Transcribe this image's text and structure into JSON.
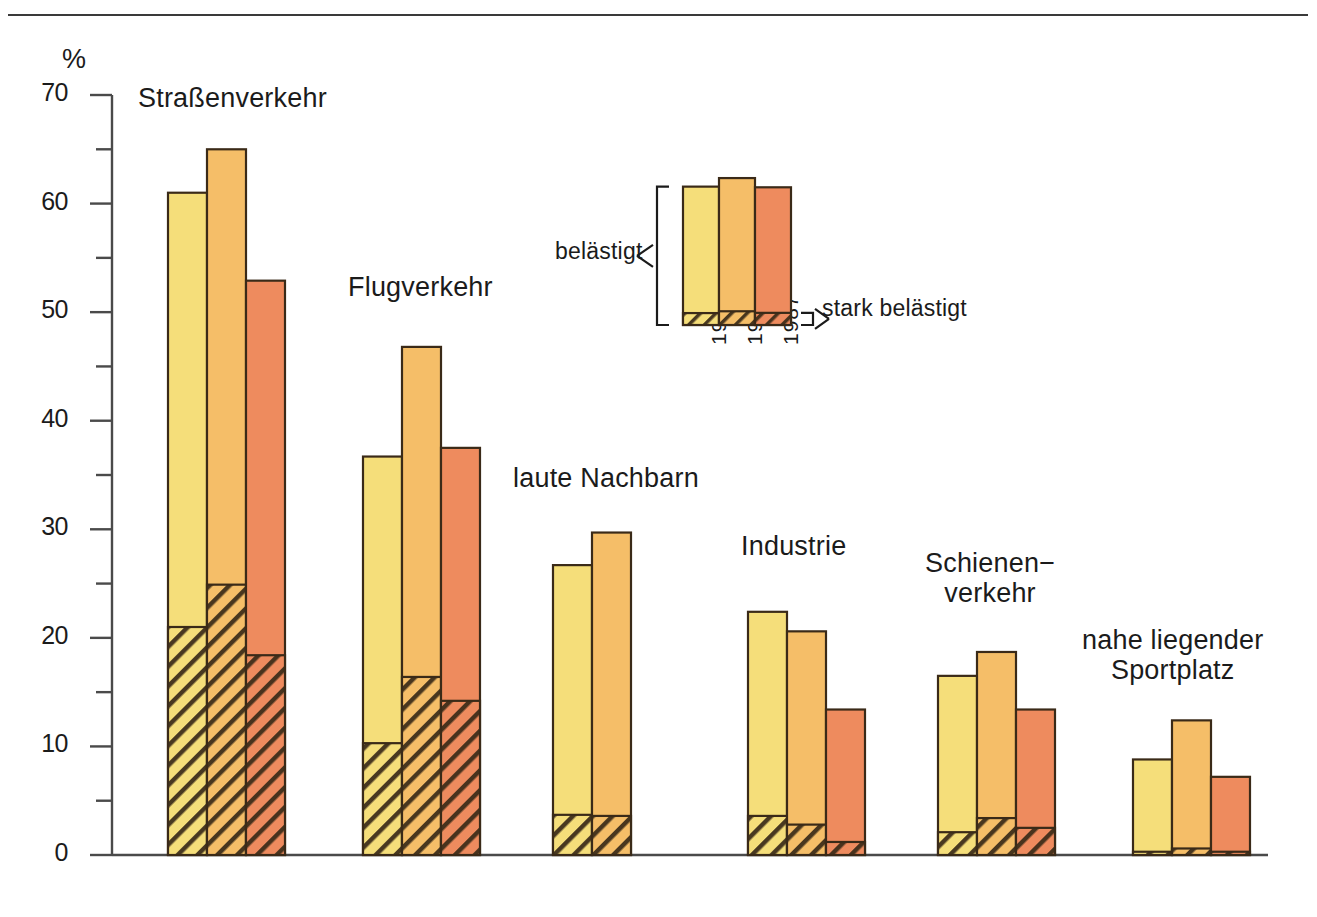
{
  "figure": {
    "y_axis_unit": "%",
    "y_ticks_major": [
      "0",
      "10",
      "20",
      "30",
      "40",
      "50",
      "60",
      "70"
    ],
    "legend": {
      "upper_label": "belästigt",
      "lower_label": "stark belästigt",
      "years": [
        "1984",
        "1986",
        "1987"
      ],
      "sample_total": [
        61.5,
        65.3,
        61.2
      ],
      "sample_strong": [
        5.3,
        6.1,
        5.4
      ]
    },
    "group_labels": {
      "strassenverkehr": "Straßenverkehr",
      "flugverkehr": "Flugverkehr",
      "laute_nachbarn": "laute Nachbarn",
      "industrie": "Industrie",
      "schienenverkehr_line1": "Schienen−",
      "schienenverkehr_line2": "verkehr",
      "sportplatz_line1": "nahe liegender",
      "sportplatz_line2": "Sportplatz"
    },
    "colors": {
      "year_1984": "#F5DE7A",
      "year_1986": "#F5BE68",
      "year_1987": "#EE8B5E",
      "outline": "#3A2A18",
      "axis": "#4a4a4a",
      "text": "#1b1b1b",
      "background": "#FFFFFF"
    }
  },
  "chart_data": {
    "type": "bar",
    "title": "",
    "subtitle": "",
    "xlabel": "",
    "ylabel": "%",
    "ylim": [
      0,
      70
    ],
    "ytick_step": 10,
    "yminor_step": 5,
    "grid": false,
    "legend_position": "inside-top-center",
    "stacked": true,
    "stack_note": "Each bar's full height = 'belästigt' (annoyed); the hatched lower segment = 'stark belästigt' (strongly annoyed), a subset of the total.",
    "categories": [
      "Straßenverkehr",
      "Flugverkehr",
      "laute Nachbarn",
      "Industrie",
      "Schienenverkehr",
      "nahe liegender Sportplatz"
    ],
    "series": [
      {
        "name": "1984 belästigt",
        "year": "1984",
        "segment": "belästigt",
        "color": "#F5DE7A",
        "values": [
          61.0,
          36.7,
          26.7,
          22.4,
          16.5,
          8.8
        ]
      },
      {
        "name": "1986 belästigt",
        "year": "1986",
        "segment": "belästigt",
        "color": "#F5BE68",
        "values": [
          65.0,
          46.8,
          29.7,
          20.6,
          18.7,
          12.4
        ]
      },
      {
        "name": "1987 belästigt",
        "year": "1987",
        "segment": "belästigt",
        "color": "#EE8B5E",
        "values": [
          52.9,
          37.5,
          null,
          13.4,
          13.4,
          7.2
        ]
      },
      {
        "name": "1984 stark belästigt",
        "year": "1984",
        "segment": "stark belästigt",
        "color": "#F5DE7A",
        "hatched": true,
        "values": [
          21.0,
          10.3,
          3.7,
          3.6,
          2.1,
          0.3
        ]
      },
      {
        "name": "1986 stark belästigt",
        "year": "1986",
        "segment": "stark belästigt",
        "color": "#F5BE68",
        "hatched": true,
        "values": [
          24.9,
          16.4,
          3.6,
          2.8,
          3.4,
          0.6
        ]
      },
      {
        "name": "1987 stark belästigt",
        "year": "1987",
        "segment": "stark belästigt",
        "color": "#EE8B5E",
        "hatched": true,
        "values": [
          18.4,
          14.2,
          null,
          1.2,
          2.5,
          0.3
        ]
      }
    ]
  },
  "geometry": {
    "baseline_y": 855,
    "top_y": 95,
    "axis_x": 112,
    "px_per_unit": 10.857,
    "bar_width": 39,
    "group_starts_x": [
      168,
      363,
      553,
      748,
      938,
      1133
    ],
    "label_positions": [
      {
        "key": "strassenverkehr",
        "x": 138,
        "y": 83
      },
      {
        "key": "flugverkehr",
        "x": 348,
        "y": 272
      },
      {
        "key": "laute_nachbarn",
        "x": 513,
        "y": 463
      },
      {
        "key": "industrie",
        "x": 741,
        "y": 531
      },
      {
        "key": "schienenverkehr",
        "x": 925,
        "y": 548
      },
      {
        "key": "sportplatz",
        "x": 1082,
        "y": 625
      }
    ],
    "legend_group_x": 683,
    "legend_baseline_y": 325
  }
}
